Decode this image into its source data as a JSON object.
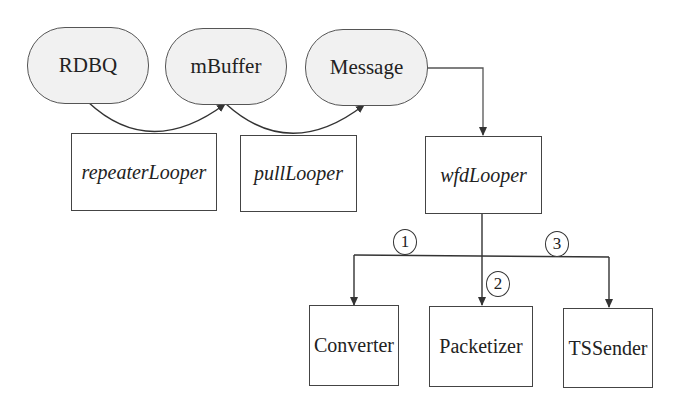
{
  "diagram": {
    "queues": [
      {
        "id": "rdbq",
        "label": "RDBQ"
      },
      {
        "id": "mbuffer",
        "label": "mBuffer"
      },
      {
        "id": "message",
        "label": "Message"
      }
    ],
    "loopers": [
      {
        "id": "repeater",
        "label": "repeaterLooper"
      },
      {
        "id": "pull",
        "label": "pullLooper"
      },
      {
        "id": "wfd",
        "label": "wfdLooper"
      }
    ],
    "components": [
      {
        "id": "converter",
        "label": "Converter"
      },
      {
        "id": "packetizer",
        "label": "Packetizer"
      },
      {
        "id": "tssender",
        "label": "TSSender"
      }
    ],
    "step_markers": [
      "1",
      "2",
      "3"
    ],
    "edges": [
      {
        "from": "RDBQ",
        "to": "mBuffer",
        "via": "repeaterLooper"
      },
      {
        "from": "mBuffer",
        "to": "Message",
        "via": "pullLooper"
      },
      {
        "from": "Message",
        "to": "wfdLooper"
      },
      {
        "from": "wfdLooper",
        "to": "Converter",
        "step": "1"
      },
      {
        "from": "wfdLooper",
        "to": "Packetizer",
        "step": "2"
      },
      {
        "from": "wfdLooper",
        "to": "TSSender",
        "step": "3"
      }
    ],
    "colors": {
      "pill_fill": "#f1f1f1",
      "stroke": "#444444",
      "background": "#ffffff"
    }
  }
}
